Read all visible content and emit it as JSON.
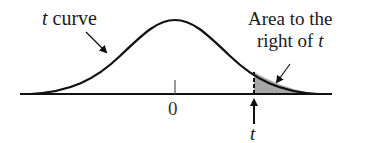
{
  "diagram": {
    "type": "t-distribution-upper-tail",
    "labels": {
      "curve_label_var": "t",
      "curve_label_text": " curve",
      "area_label_line1": "Area to the",
      "area_label_line2_text": "right of ",
      "area_label_line2_var": "t",
      "zero_tick": "0",
      "t_marker": "t"
    },
    "colors": {
      "stroke": "#111111",
      "shade": "#a6a6a6",
      "background": "#ffffff"
    }
  }
}
